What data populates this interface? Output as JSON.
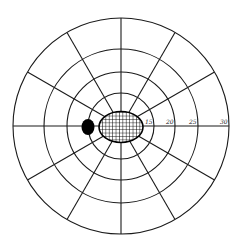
{
  "diagram": {
    "type": "visual-field-perimetry-chart",
    "center": {
      "x": 121,
      "y": 126
    },
    "rings": [
      {
        "radius": 33,
        "label": "15"
      },
      {
        "radius": 54,
        "label": "20"
      },
      {
        "radius": 77,
        "label": "25"
      },
      {
        "radius": 108,
        "label": "30"
      }
    ],
    "spoke_count": 12,
    "spoke_angle_step_deg": 30,
    "scale_labels": [
      "15",
      "20",
      "25",
      "30"
    ],
    "blind_spot": {
      "cx": 88,
      "cy": 127,
      "rx": 6.5,
      "ry": 8,
      "color": "#000000"
    },
    "scotoma": {
      "cx": 121,
      "cy": 127,
      "rx": 22,
      "ry": 15.5,
      "hatch": "grid",
      "hatch_spacing": 3.4,
      "color": "#000000"
    },
    "colors": {
      "line": "#1a1a1a",
      "background": "#ffffff"
    }
  }
}
